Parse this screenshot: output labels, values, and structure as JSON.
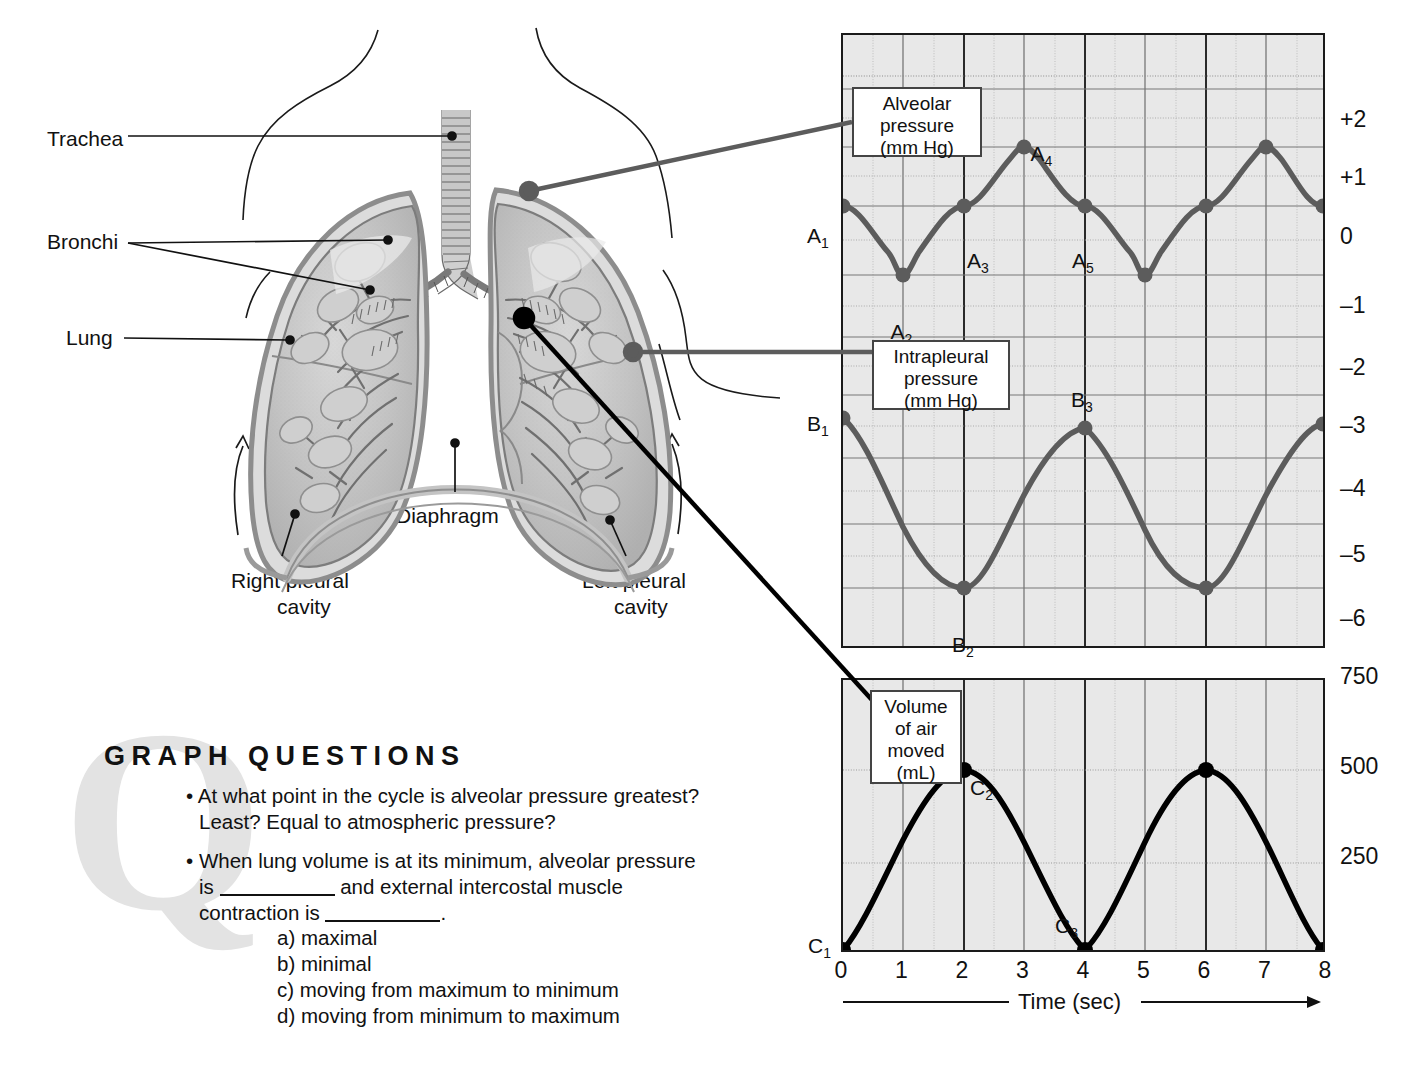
{
  "figure": {
    "anatomy_labels": [
      {
        "name": "trachea",
        "text": "Trachea",
        "x": 47,
        "y": 126
      },
      {
        "name": "bronchi",
        "text": "Bronchi",
        "x": 47,
        "y": 229
      },
      {
        "name": "lung",
        "text": "Lung",
        "x": 66,
        "y": 325
      },
      {
        "name": "diaphragm",
        "text": "Diaphragm",
        "x": 396,
        "y": 503
      },
      {
        "name": "right-pleural-cavity",
        "text": "Right pleural",
        "x": 231,
        "y": 568
      },
      {
        "name": "right-pleural-cavity-2",
        "text": "cavity",
        "x": 277,
        "y": 594
      },
      {
        "name": "left-pleural-cavity",
        "text": "Left pleural",
        "x": 582,
        "y": 568
      },
      {
        "name": "left-pleural-cavity-2",
        "text": "cavity",
        "x": 614,
        "y": 594
      }
    ],
    "callouts": {
      "alveolar": {
        "lines": [
          "Alveolar",
          "pressure",
          "(mm Hg)"
        ]
      },
      "intrapleural": {
        "lines": [
          "Intrapleural",
          "pressure",
          "(mm Hg)"
        ]
      },
      "volume": {
        "lines": [
          "Volume",
          "of air",
          "moved",
          "(mL)"
        ]
      }
    }
  },
  "chart_data": [
    {
      "type": "line",
      "title": "Alveolar pressure (mm Hg)",
      "xlabel": "Time (sec)",
      "ylabel": "mm Hg",
      "xlim": [
        0,
        8
      ],
      "ylim": [
        -6,
        2
      ],
      "grid": true,
      "yticks": [
        "+2",
        "+1",
        "0",
        "–1",
        "–2",
        "–3",
        "–4",
        "–5",
        "–6"
      ],
      "ytick_values": [
        2,
        1,
        0,
        -1,
        -2,
        -3,
        -4,
        -5,
        -6
      ],
      "phases": [
        {
          "label": "Inspiration",
          "start": 0,
          "end": 2
        },
        {
          "label": "Expiration",
          "start": 2,
          "end": 4
        },
        {
          "label": "Inspiration",
          "start": 4,
          "end": 6
        },
        {
          "label": "Expiration",
          "start": 6,
          "end": 8
        }
      ],
      "series": [
        {
          "name": "Alveolar pressure",
          "color": "#5c5c5c",
          "points": [
            {
              "x": 0,
              "y": 0,
              "label": "A1"
            },
            {
              "x": 1,
              "y": -1.1,
              "label": "A2"
            },
            {
              "x": 2,
              "y": 0,
              "label": "A3"
            },
            {
              "x": 3,
              "y": 1.1,
              "label": "A4"
            },
            {
              "x": 4,
              "y": 0,
              "label": "A5"
            },
            {
              "x": 5,
              "y": -1.1,
              "label": ""
            },
            {
              "x": 6,
              "y": 0,
              "label": ""
            },
            {
              "x": 7,
              "y": 1.1,
              "label": ""
            },
            {
              "x": 8,
              "y": 0,
              "label": ""
            }
          ]
        },
        {
          "name": "Intrapleural pressure",
          "color": "#5c5c5c",
          "points": [
            {
              "x": 0,
              "y": -2.9,
              "label": "B1"
            },
            {
              "x": 2,
              "y": -6.0,
              "label": "B2"
            },
            {
              "x": 4,
              "y": -2.8,
              "label": "B3"
            },
            {
              "x": 6,
              "y": -6.0,
              "label": ""
            },
            {
              "x": 8,
              "y": -2.8,
              "label": ""
            }
          ]
        }
      ]
    },
    {
      "type": "line",
      "title": "Volume of air moved (mL)",
      "xlabel": "Time (sec)",
      "ylabel": "mL",
      "xlim": [
        0,
        8
      ],
      "ylim": [
        0,
        750
      ],
      "grid": true,
      "yticks": [
        "750",
        "500",
        "250"
      ],
      "ytick_values": [
        750,
        500,
        250
      ],
      "xticks": [
        "0",
        "1",
        "2",
        "3",
        "4",
        "5",
        "6",
        "7",
        "8"
      ],
      "series": [
        {
          "name": "Volume of air moved",
          "color": "#000000",
          "points": [
            {
              "x": 0,
              "y": 0,
              "label": "C1"
            },
            {
              "x": 2,
              "y": 500,
              "label": "C2"
            },
            {
              "x": 4,
              "y": 0,
              "label": "C3"
            },
            {
              "x": 6,
              "y": 500,
              "label": ""
            },
            {
              "x": 8,
              "y": 0,
              "label": ""
            }
          ]
        }
      ]
    }
  ],
  "axis": {
    "time_label": "Time (sec)"
  },
  "questions": {
    "watermark": "Q",
    "heading": "GRAPH QUESTIONS",
    "q1_line1": "At what point in the cycle is alveolar pressure greatest?",
    "q1_line2": "Least? Equal to atmospheric pressure?",
    "q2_line1": "When lung volume is at its minimum, alveolar pressure",
    "q2_line2_a": "is",
    "q2_line2_b": "and external intercostal muscle",
    "q2_line3_a": "contraction is",
    "q2_line3_b": ".",
    "options": [
      "a) maximal",
      "b) minimal",
      "c) moving from maximum to minimum",
      "d) moving from minimum to maximum"
    ]
  }
}
